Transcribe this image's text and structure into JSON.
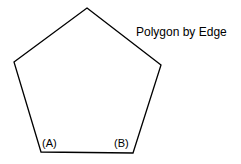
{
  "diagram": {
    "title": "Polygon by Edge",
    "shape": "pentagon",
    "vertices": [
      [
        87,
        8
      ],
      [
        161,
        65
      ],
      [
        133,
        153
      ],
      [
        41,
        152
      ],
      [
        14,
        62
      ]
    ],
    "stroke_color": "#000000",
    "labels": {
      "a": "(A)",
      "b": "(B)"
    }
  }
}
